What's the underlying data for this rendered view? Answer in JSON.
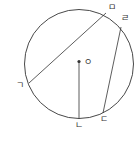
{
  "diagram": {
    "center_label": "ㅇ",
    "points": {
      "g": "ㄱ",
      "n": "ㄴ",
      "d": "ㄷ",
      "r": "ㄹ",
      "m": "ㅁ"
    },
    "segments": [
      "ㄱㅁ",
      "ㄷㄹ",
      "ㅇㄴ"
    ],
    "colors": {
      "stroke": "#333333",
      "background": "#ffffff"
    }
  }
}
